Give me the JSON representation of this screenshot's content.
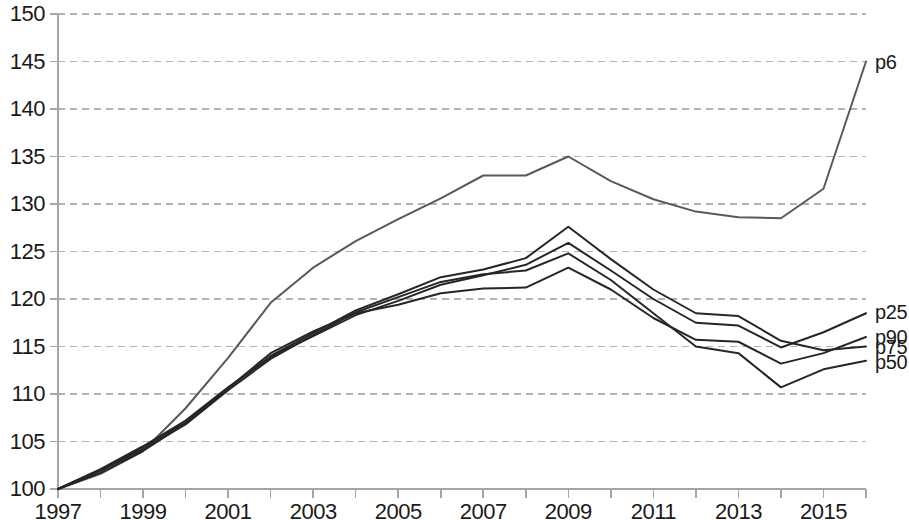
{
  "chart_data": {
    "type": "line",
    "title": "",
    "subtitle": "",
    "xlabel": "",
    "ylabel": "",
    "xlim": [
      1997,
      2016
    ],
    "ylim": [
      100,
      150
    ],
    "ytick_step": 5,
    "xtick_step": 1,
    "xlabel_step": 2,
    "grid": true,
    "grid_axis": "y",
    "grid_style": "dashed",
    "legend_position": "right-inline",
    "x": [
      1997,
      1998,
      1999,
      2000,
      2001,
      2002,
      2003,
      2004,
      2005,
      2006,
      2007,
      2008,
      2009,
      2010,
      2011,
      2012,
      2013,
      2014,
      2015,
      2016
    ],
    "yticks": [
      100,
      105,
      110,
      115,
      120,
      125,
      130,
      135,
      140,
      145,
      150
    ],
    "ytick_labels": [
      "100",
      "105",
      "110",
      "115",
      "120",
      "125",
      "130",
      "135",
      "140",
      "145",
      "150"
    ],
    "xticks": [
      1997,
      1998,
      1999,
      2000,
      2001,
      2002,
      2003,
      2004,
      2005,
      2006,
      2007,
      2008,
      2009,
      2010,
      2011,
      2012,
      2013,
      2014,
      2015,
      2016
    ],
    "xtick_labels": [
      "1997",
      "",
      "1999",
      "",
      "2001",
      "",
      "2003",
      "",
      "2005",
      "",
      "2007",
      "",
      "2009",
      "",
      "2011",
      "",
      "2013",
      "",
      "2015",
      ""
    ],
    "series": [
      {
        "name": "p6",
        "color": "#595959",
        "width": 2.0,
        "label_value": "145.0",
        "values": [
          100.0,
          101.6,
          104.0,
          108.5,
          113.8,
          119.6,
          123.3,
          126.1,
          128.4,
          130.6,
          133.0,
          133.0,
          135.0,
          132.4,
          130.5,
          129.2,
          128.6,
          128.5,
          131.6,
          145.0
        ]
      },
      {
        "name": "p25",
        "color": "#262626",
        "width": 2.0,
        "label_value": "118.5",
        "values": [
          100.0,
          102.1,
          104.5,
          107.2,
          110.7,
          113.9,
          116.1,
          118.3,
          119.8,
          121.5,
          122.5,
          123.6,
          125.9,
          123.0,
          120.0,
          117.5,
          117.2,
          114.9,
          116.5,
          118.5
        ]
      },
      {
        "name": "p90",
        "color": "#262626",
        "width": 2.0,
        "label_value": "116.0",
        "values": [
          100.0,
          101.7,
          104.0,
          106.9,
          110.6,
          114.3,
          116.6,
          118.5,
          119.4,
          120.6,
          121.1,
          121.2,
          123.3,
          121.0,
          118.0,
          115.7,
          115.5,
          113.2,
          114.3,
          116.0
        ]
      },
      {
        "name": "p75",
        "color": "#262626",
        "width": 2.0,
        "label_value": "115.0",
        "values": [
          100.0,
          102.0,
          104.4,
          107.0,
          110.6,
          114.0,
          116.4,
          118.8,
          120.5,
          122.3,
          123.1,
          124.3,
          127.6,
          124.2,
          121.0,
          118.5,
          118.2,
          115.6,
          114.6,
          115.0
        ]
      },
      {
        "name": "p50",
        "color": "#262626",
        "width": 2.0,
        "label_value": "113.5",
        "values": [
          100.0,
          101.9,
          104.2,
          106.8,
          110.4,
          113.7,
          116.2,
          118.6,
          120.2,
          121.8,
          122.6,
          123.0,
          124.8,
          122.0,
          118.5,
          115.0,
          114.3,
          110.7,
          112.6,
          113.5
        ]
      }
    ],
    "series_labels": [
      {
        "name": "p6",
        "text": "p6"
      },
      {
        "name": "p25",
        "text": "p25"
      },
      {
        "name": "p90",
        "text": "p90"
      },
      {
        "name": "p75",
        "text": "p75"
      },
      {
        "name": "p50",
        "text": "p50"
      }
    ],
    "axis_color": "#a6a6a6",
    "grid_color": "#b3b3b3",
    "text_color": "#1a1a1a"
  }
}
